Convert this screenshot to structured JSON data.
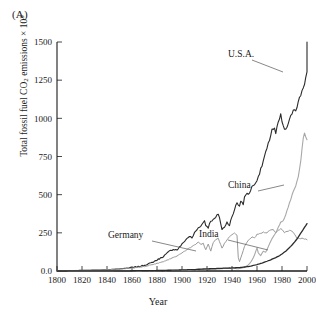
{
  "figure": {
    "panel_label": "(A)"
  },
  "chart_data": {
    "type": "line",
    "title": "",
    "subtitle": "",
    "xlabel": "Year",
    "ylabel": "Total fossil fuel CO2 emissions × 10^3",
    "ylabel_parts": {
      "prefix": "Total fossil fuel CO",
      "subscript": "2",
      "middle": " emissions × 10",
      "superscript": "3"
    },
    "xlim": [
      1800,
      2000
    ],
    "ylim": [
      0,
      1500
    ],
    "xticks": [
      1800,
      1820,
      1840,
      1860,
      1880,
      1900,
      1920,
      1940,
      1960,
      1980,
      2000
    ],
    "xticklabels": [
      "1800",
      "1820",
      "1840",
      "1860",
      "1880",
      "1900",
      "1920",
      "1940",
      "1960",
      "1980",
      "2000"
    ],
    "yticks": [
      0,
      250,
      500,
      750,
      1000,
      1250,
      1500
    ],
    "yticklabels": [
      "0.0",
      "250",
      "500",
      "750",
      "1000",
      "1250",
      "1500"
    ],
    "grid": false,
    "legend_position": "inline-annotations",
    "annotations": [
      {
        "text": "U.S.A.",
        "color": "#2b2b2b"
      },
      {
        "text": "China",
        "color": "#2b2b2b"
      },
      {
        "text": "Germany",
        "color": "#2b2b2b"
      },
      {
        "text": "India",
        "color": "#2b2b2b"
      }
    ],
    "series": [
      {
        "name": "U.S.A.",
        "color": "#2b2b2b",
        "linewidth": 1.1,
        "x": [
          1800,
          1820,
          1840,
          1850,
          1860,
          1865,
          1870,
          1875,
          1880,
          1885,
          1890,
          1893,
          1896,
          1900,
          1903,
          1906,
          1908,
          1910,
          1913,
          1916,
          1918,
          1919,
          1921,
          1923,
          1925,
          1927,
          1929,
          1930,
          1932,
          1934,
          1936,
          1938,
          1939,
          1941,
          1943,
          1944,
          1946,
          1947,
          1949,
          1950,
          1952,
          1954,
          1956,
          1958,
          1960,
          1962,
          1964,
          1966,
          1968,
          1970,
          1972,
          1974,
          1975,
          1977,
          1979,
          1980,
          1982,
          1983,
          1985,
          1987,
          1989,
          1991,
          1992,
          1994,
          1996,
          1998,
          2000
        ],
        "y": [
          2,
          4,
          8,
          14,
          22,
          28,
          38,
          52,
          72,
          95,
          130,
          142,
          138,
          175,
          205,
          228,
          215,
          250,
          282,
          305,
          330,
          300,
          285,
          330,
          335,
          350,
          375,
          350,
          270,
          290,
          320,
          300,
          330,
          375,
          430,
          450,
          420,
          460,
          440,
          480,
          510,
          505,
          560,
          560,
          600,
          640,
          690,
          750,
          800,
          860,
          930,
          930,
          900,
          970,
          1020,
          980,
          920,
          930,
          960,
          1010,
          1060,
          1060,
          1080,
          1130,
          1180,
          1230,
          1300
        ],
        "end_value": 1500,
        "peak_value": 1500
      },
      {
        "name": "China",
        "color": "#a8a8a8",
        "linewidth": 1.1,
        "x": [
          1800,
          1880,
          1900,
          1920,
          1930,
          1940,
          1945,
          1950,
          1953,
          1956,
          1958,
          1960,
          1961,
          1963,
          1965,
          1967,
          1969,
          1971,
          1973,
          1975,
          1977,
          1979,
          1981,
          1983,
          1985,
          1987,
          1989,
          1991,
          1993,
          1995,
          1996,
          1997,
          1998,
          2000
        ],
        "y": [
          0,
          2,
          5,
          10,
          14,
          20,
          14,
          22,
          40,
          70,
          105,
          150,
          120,
          100,
          130,
          125,
          160,
          195,
          225,
          250,
          285,
          320,
          330,
          370,
          420,
          470,
          520,
          560,
          620,
          720,
          800,
          870,
          900,
          860
        ],
        "end_value": 860,
        "peak_value": 900
      },
      {
        "name": "Germany",
        "color": "#9a9a9a",
        "linewidth": 1.0,
        "x": [
          1800,
          1820,
          1840,
          1860,
          1870,
          1880,
          1885,
          1890,
          1895,
          1900,
          1905,
          1910,
          1913,
          1915,
          1917,
          1919,
          1921,
          1923,
          1925,
          1927,
          1929,
          1930,
          1932,
          1934,
          1936,
          1938,
          1940,
          1942,
          1944,
          1945,
          1946,
          1948,
          1950,
          1953,
          1956,
          1958,
          1960,
          1963,
          1965,
          1968,
          1970,
          1973,
          1975,
          1977,
          1979,
          1980,
          1982,
          1984,
          1986,
          1988,
          1989,
          1990,
          1992,
          1994,
          1996,
          1998,
          2000
        ],
        "y": [
          2,
          4,
          8,
          18,
          30,
          50,
          62,
          78,
          95,
          120,
          145,
          170,
          190,
          175,
          180,
          140,
          175,
          130,
          185,
          205,
          215,
          190,
          150,
          180,
          205,
          225,
          240,
          250,
          235,
          90,
          60,
          110,
          160,
          200,
          225,
          215,
          240,
          245,
          255,
          250,
          265,
          270,
          250,
          265,
          275,
          270,
          250,
          260,
          265,
          260,
          255,
          240,
          215,
          210,
          215,
          210,
          205
        ],
        "end_value": 205,
        "peak_value": 275
      },
      {
        "name": "India",
        "color": "#2b2b2b",
        "linewidth": 1.3,
        "x": [
          1800,
          1850,
          1880,
          1900,
          1910,
          1920,
          1930,
          1940,
          1945,
          1950,
          1955,
          1960,
          1965,
          1970,
          1975,
          1978,
          1980,
          1983,
          1985,
          1988,
          1990,
          1992,
          1994,
          1996,
          1998,
          2000
        ],
        "y": [
          0,
          1,
          3,
          7,
          10,
          14,
          17,
          20,
          22,
          26,
          32,
          42,
          55,
          70,
          88,
          100,
          112,
          130,
          145,
          170,
          190,
          210,
          235,
          260,
          285,
          310
        ],
        "end_value": 310,
        "peak_value": 310
      }
    ]
  },
  "colors": {
    "usa": "#2b2b2b",
    "china": "#a8a8a8",
    "germany": "#9a9a9a",
    "india": "#2b2b2b",
    "axis": "#1a1a1a",
    "background": "#ffffff"
  }
}
